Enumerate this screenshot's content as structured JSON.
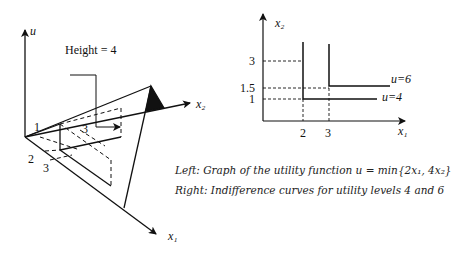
{
  "left_figure": {
    "axes": {
      "vertical": "u",
      "right": "x₂",
      "down": "x₁"
    },
    "height_label": "Height = 4",
    "tick_labels": {
      "x2_one": "1",
      "x1_two": "2",
      "x1_three": "3",
      "inner_three": "3"
    }
  },
  "right_figure": {
    "axes": {
      "y": "x₂",
      "x": "x₁"
    },
    "y_ticks": [
      "3",
      "1.5",
      "1"
    ],
    "x_ticks": [
      "2",
      "3"
    ],
    "curves": [
      {
        "label": "u=4",
        "corner": [
          2,
          1
        ]
      },
      {
        "label": "u=6",
        "corner": [
          3,
          1.5
        ]
      }
    ]
  },
  "caption": {
    "left": "Left: Graph of the utility function u = min{2x₁, 4x₂}",
    "right": "Right: Indifference curves for utility levels 4 and 6"
  }
}
